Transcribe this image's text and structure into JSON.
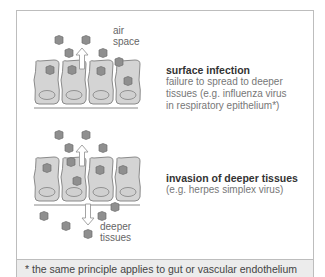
{
  "labels": {
    "air_space": [
      "air",
      "space"
    ],
    "deeper_tissues": [
      "deeper",
      "tissues"
    ]
  },
  "panels": [
    {
      "title": "surface infection",
      "description": [
        "failure to spread to deeper",
        "tissues (e.g. influenza virus",
        "in respiratory epithelium*)"
      ]
    },
    {
      "title": "invasion of deeper tissues",
      "description": [
        "(e.g. herpes simplex virus)"
      ]
    }
  ],
  "footnote": "* the same principle applies to gut or vascular endothelium",
  "colors": {
    "cell_fill": "#d4d4d4",
    "cell_stroke": "#8a8a8a",
    "virus_fill": "#8f8f8f",
    "frame": "#bdbdbd",
    "footnote_bg": "#ececec"
  }
}
